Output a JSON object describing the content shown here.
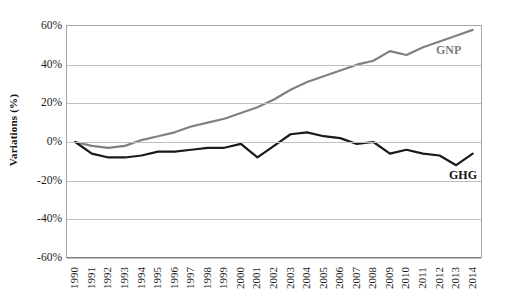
{
  "chart_data": {
    "type": "line",
    "title": "",
    "xlabel": "",
    "ylabel": "Variations (%)",
    "ylim": [
      -60,
      60
    ],
    "ytick_labels": [
      "60%",
      "40%",
      "20%",
      "0%",
      "-20%",
      "-40%",
      "-60%"
    ],
    "ytick_values": [
      60,
      40,
      20,
      0,
      -20,
      -40,
      -60
    ],
    "grid": true,
    "legend_position": "inline-right",
    "categories": [
      "1990",
      "1991",
      "1992",
      "1993",
      "1994",
      "1995",
      "1996",
      "1997",
      "1998",
      "1999",
      "2000",
      "2001",
      "2002",
      "2003",
      "2004",
      "2005",
      "2006",
      "2007",
      "2008",
      "2009",
      "2010",
      "2011",
      "2012",
      "2013",
      "2014"
    ],
    "series": [
      {
        "name": "GNP",
        "color": "#808080",
        "values": [
          0,
          -2,
          -3,
          -2,
          1,
          3,
          5,
          8,
          10,
          12,
          15,
          18,
          22,
          27,
          31,
          34,
          37,
          40,
          42,
          47,
          45,
          49,
          52,
          55,
          58
        ]
      },
      {
        "name": "GHG",
        "color": "#1a1a1a",
        "values": [
          0,
          -6,
          -8,
          -8,
          -7,
          -5,
          -5,
          -4,
          -3,
          -3,
          -1,
          -8,
          -2,
          4,
          5,
          3,
          2,
          -1,
          0,
          -6,
          -4,
          -6,
          -7,
          -12,
          -6
        ]
      }
    ],
    "annotations": [
      {
        "name": "GNP",
        "text": "GNP",
        "color": "#808080"
      },
      {
        "name": "GHG",
        "text": "GHG",
        "color": "#1a1a1a"
      }
    ]
  },
  "axis": {
    "y_title": "Variations (%)"
  }
}
